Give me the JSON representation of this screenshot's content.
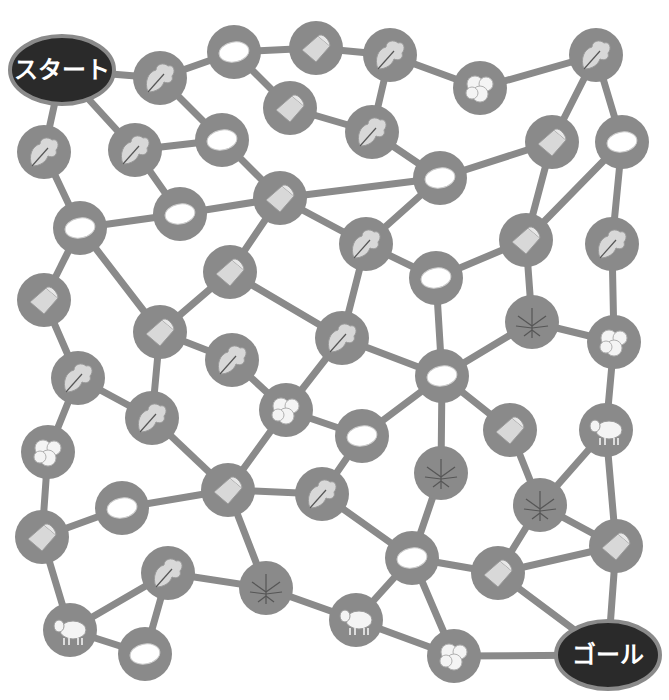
{
  "puzzle": {
    "start_label": "スタート",
    "goal_label": "ゴール",
    "colors": {
      "edge": "#8a8a8a",
      "node": "#8a8a8a",
      "terminal": "#2a2a2a",
      "terminal_text": "#ffffff"
    },
    "icon_types": [
      "leaf",
      "cocoon",
      "cloth",
      "cotton",
      "hemp",
      "sheep"
    ],
    "start": {
      "x": 62,
      "y": 70,
      "rx": 52,
      "ry": 34
    },
    "goal": {
      "x": 608,
      "y": 655,
      "rx": 52,
      "ry": 34
    },
    "nodes": [
      {
        "id": "n1",
        "x": 160,
        "y": 78,
        "icon": "leaf"
      },
      {
        "id": "n2",
        "x": 234,
        "y": 52,
        "icon": "cocoon"
      },
      {
        "id": "n3",
        "x": 316,
        "y": 48,
        "icon": "cloth"
      },
      {
        "id": "n4",
        "x": 390,
        "y": 55,
        "icon": "leaf"
      },
      {
        "id": "n5",
        "x": 480,
        "y": 88,
        "icon": "cotton"
      },
      {
        "id": "n6",
        "x": 596,
        "y": 55,
        "icon": "leaf"
      },
      {
        "id": "n7",
        "x": 290,
        "y": 108,
        "icon": "cloth"
      },
      {
        "id": "n8",
        "x": 372,
        "y": 132,
        "icon": "leaf"
      },
      {
        "id": "n9",
        "x": 44,
        "y": 152,
        "icon": "leaf"
      },
      {
        "id": "n10",
        "x": 135,
        "y": 150,
        "icon": "leaf"
      },
      {
        "id": "n11",
        "x": 222,
        "y": 140,
        "icon": "cocoon"
      },
      {
        "id": "n12",
        "x": 440,
        "y": 178,
        "icon": "cocoon"
      },
      {
        "id": "n13",
        "x": 552,
        "y": 142,
        "icon": "cloth"
      },
      {
        "id": "n14",
        "x": 622,
        "y": 142,
        "icon": "cocoon"
      },
      {
        "id": "n15",
        "x": 80,
        "y": 228,
        "icon": "cocoon"
      },
      {
        "id": "n16",
        "x": 180,
        "y": 214,
        "icon": "cocoon"
      },
      {
        "id": "n17",
        "x": 280,
        "y": 198,
        "icon": "cloth"
      },
      {
        "id": "n18",
        "x": 366,
        "y": 244,
        "icon": "leaf"
      },
      {
        "id": "n19",
        "x": 436,
        "y": 278,
        "icon": "cocoon"
      },
      {
        "id": "n20",
        "x": 526,
        "y": 240,
        "icon": "cloth"
      },
      {
        "id": "n21",
        "x": 612,
        "y": 244,
        "icon": "leaf"
      },
      {
        "id": "n22",
        "x": 44,
        "y": 300,
        "icon": "cloth"
      },
      {
        "id": "n23",
        "x": 230,
        "y": 272,
        "icon": "cloth"
      },
      {
        "id": "n24",
        "x": 160,
        "y": 332,
        "icon": "cloth"
      },
      {
        "id": "n25",
        "x": 232,
        "y": 360,
        "icon": "leaf"
      },
      {
        "id": "n26",
        "x": 342,
        "y": 338,
        "icon": "leaf"
      },
      {
        "id": "n27",
        "x": 532,
        "y": 322,
        "icon": "hemp"
      },
      {
        "id": "n28",
        "x": 614,
        "y": 342,
        "icon": "cotton"
      },
      {
        "id": "n29",
        "x": 78,
        "y": 378,
        "icon": "leaf"
      },
      {
        "id": "n30",
        "x": 152,
        "y": 418,
        "icon": "leaf"
      },
      {
        "id": "n31",
        "x": 286,
        "y": 410,
        "icon": "cotton"
      },
      {
        "id": "n32",
        "x": 442,
        "y": 376,
        "icon": "cocoon"
      },
      {
        "id": "n33",
        "x": 510,
        "y": 430,
        "icon": "cloth"
      },
      {
        "id": "n34",
        "x": 606,
        "y": 430,
        "icon": "sheep"
      },
      {
        "id": "n35",
        "x": 48,
        "y": 452,
        "icon": "cotton"
      },
      {
        "id": "n36",
        "x": 362,
        "y": 436,
        "icon": "cocoon"
      },
      {
        "id": "n37",
        "x": 441,
        "y": 473,
        "icon": "hemp"
      },
      {
        "id": "n38",
        "x": 122,
        "y": 508,
        "icon": "cocoon"
      },
      {
        "id": "n39",
        "x": 228,
        "y": 490,
        "icon": "cloth"
      },
      {
        "id": "n40",
        "x": 322,
        "y": 494,
        "icon": "leaf"
      },
      {
        "id": "n41",
        "x": 540,
        "y": 505,
        "icon": "hemp"
      },
      {
        "id": "n42",
        "x": 42,
        "y": 537,
        "icon": "cloth"
      },
      {
        "id": "n43",
        "x": 168,
        "y": 573,
        "icon": "leaf"
      },
      {
        "id": "n44",
        "x": 266,
        "y": 588,
        "icon": "hemp"
      },
      {
        "id": "n45",
        "x": 412,
        "y": 558,
        "icon": "cocoon"
      },
      {
        "id": "n46",
        "x": 498,
        "y": 573,
        "icon": "cloth"
      },
      {
        "id": "n47",
        "x": 616,
        "y": 546,
        "icon": "cloth"
      },
      {
        "id": "n48",
        "x": 70,
        "y": 630,
        "icon": "sheep"
      },
      {
        "id": "n49",
        "x": 145,
        "y": 654,
        "icon": "cocoon"
      },
      {
        "id": "n50",
        "x": 356,
        "y": 620,
        "icon": "sheep"
      },
      {
        "id": "n51",
        "x": 454,
        "y": 656,
        "icon": "cotton"
      }
    ],
    "edges": [
      [
        "start",
        "n1"
      ],
      [
        "start",
        "n9"
      ],
      [
        "start",
        "n10"
      ],
      [
        "n1",
        "n2"
      ],
      [
        "n1",
        "n11"
      ],
      [
        "n2",
        "n3"
      ],
      [
        "n2",
        "n7"
      ],
      [
        "n3",
        "n4"
      ],
      [
        "n4",
        "n5"
      ],
      [
        "n4",
        "n8"
      ],
      [
        "n5",
        "n6"
      ],
      [
        "n6",
        "n13"
      ],
      [
        "n6",
        "n14"
      ],
      [
        "n7",
        "n8"
      ],
      [
        "n8",
        "n12"
      ],
      [
        "n9",
        "n15"
      ],
      [
        "n10",
        "n11"
      ],
      [
        "n10",
        "n16"
      ],
      [
        "n11",
        "n17"
      ],
      [
        "n12",
        "n13"
      ],
      [
        "n12",
        "n17"
      ],
      [
        "n12",
        "n18"
      ],
      [
        "n13",
        "n20"
      ],
      [
        "n14",
        "n20"
      ],
      [
        "n14",
        "n21"
      ],
      [
        "n15",
        "n16"
      ],
      [
        "n15",
        "n22"
      ],
      [
        "n15",
        "n24"
      ],
      [
        "n16",
        "n17"
      ],
      [
        "n17",
        "n23"
      ],
      [
        "n17",
        "n18"
      ],
      [
        "n18",
        "n19"
      ],
      [
        "n18",
        "n26"
      ],
      [
        "n19",
        "n20"
      ],
      [
        "n19",
        "n32"
      ],
      [
        "n20",
        "n27"
      ],
      [
        "n21",
        "n28"
      ],
      [
        "n22",
        "n29"
      ],
      [
        "n23",
        "n24"
      ],
      [
        "n23",
        "n26"
      ],
      [
        "n24",
        "n25"
      ],
      [
        "n24",
        "n30"
      ],
      [
        "n26",
        "n31"
      ],
      [
        "n26",
        "n32"
      ],
      [
        "n27",
        "n28"
      ],
      [
        "n27",
        "n32"
      ],
      [
        "n28",
        "n34"
      ],
      [
        "n29",
        "n30"
      ],
      [
        "n29",
        "n35"
      ],
      [
        "n30",
        "n39"
      ],
      [
        "n25",
        "n31"
      ],
      [
        "n31",
        "n36"
      ],
      [
        "n31",
        "n39"
      ],
      [
        "n32",
        "n36"
      ],
      [
        "n32",
        "n37"
      ],
      [
        "n32",
        "n33"
      ],
      [
        "n33",
        "n41"
      ],
      [
        "n34",
        "n41"
      ],
      [
        "n34",
        "n47"
      ],
      [
        "n35",
        "n42"
      ],
      [
        "n36",
        "n40"
      ],
      [
        "n37",
        "n45"
      ],
      [
        "n38",
        "n39"
      ],
      [
        "n38",
        "n42"
      ],
      [
        "n39",
        "n40"
      ],
      [
        "n39",
        "n44"
      ],
      [
        "n40",
        "n45"
      ],
      [
        "n41",
        "n46"
      ],
      [
        "n41",
        "n47"
      ],
      [
        "n42",
        "n48"
      ],
      [
        "n43",
        "n44"
      ],
      [
        "n43",
        "n48"
      ],
      [
        "n43",
        "n49"
      ],
      [
        "n44",
        "n50"
      ],
      [
        "n45",
        "n46"
      ],
      [
        "n45",
        "n50"
      ],
      [
        "n45",
        "n51"
      ],
      [
        "n46",
        "n47"
      ],
      [
        "n46",
        "goal"
      ],
      [
        "n47",
        "goal"
      ],
      [
        "n48",
        "n49"
      ],
      [
        "n50",
        "n51"
      ],
      [
        "n51",
        "goal"
      ]
    ]
  }
}
